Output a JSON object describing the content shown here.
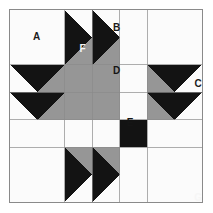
{
  "diagram": {
    "type": "quilt-block",
    "grid": {
      "columns": 7,
      "rows": 7,
      "unit": 27.714
    },
    "frame": {
      "border_color": "#8a8a8a",
      "border_width": 1.5
    },
    "palette": {
      "background": "#fbfbfb",
      "white": "#fbfbfb",
      "gray": "#969696",
      "black": "#131313",
      "outline": "#8a8a8a",
      "label_on_light": "#1b1b1b",
      "label_on_dark": "#f6f6f6"
    },
    "labels": [
      {
        "id": "A",
        "text": "A",
        "x": 13.8,
        "y": 13.8,
        "tone": "on-light",
        "piece": "plain-white-corner-square"
      },
      {
        "id": "B",
        "text": "B",
        "x": 55.0,
        "y": 9.5,
        "tone": "on-light",
        "piece": "white-triangle-top"
      },
      {
        "id": "F",
        "text": "F",
        "x": 37.5,
        "y": 20.0,
        "tone": "on-dark",
        "piece": "black-triangle-left"
      },
      {
        "id": "D",
        "text": "D",
        "x": 55.0,
        "y": 31.5,
        "tone": "on-mid",
        "piece": "gray-triangle-down"
      },
      {
        "id": "C",
        "text": "C",
        "x": 97.0,
        "y": 38.0,
        "tone": "on-light",
        "piece": "white-vertical-sashing"
      },
      {
        "id": "E",
        "text": "E",
        "x": 62.0,
        "y": 58.0,
        "tone": "on-mid",
        "piece": "gray-center-square"
      },
      {
        "id": "G",
        "text": "G",
        "x": 97.0,
        "y": 97.0,
        "tone": "on-dark",
        "piece": "black-center-square"
      }
    ],
    "legend": {
      "A": "A",
      "B": "B",
      "C": "C",
      "D": "D",
      "E": "E",
      "F": "F",
      "G": "G"
    }
  }
}
